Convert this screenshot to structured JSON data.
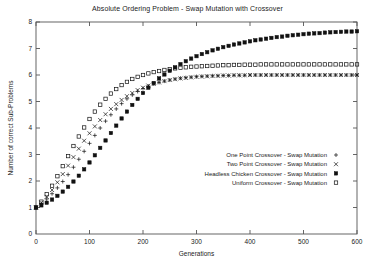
{
  "chart_data": {
    "type": "scatter",
    "title": "Absolute Ordering Problem - Swap Mutation with Crossover",
    "xlabel": "Generations",
    "ylabel": "Number of correct Sub-Problems",
    "xlim": [
      0,
      600
    ],
    "ylim": [
      0,
      8
    ],
    "xticks": [
      0,
      100,
      200,
      300,
      400,
      500,
      600
    ],
    "yticks": [
      1,
      2,
      3,
      4,
      5,
      6,
      7,
      8
    ],
    "grid": false,
    "legend_position": "center-right",
    "series": [
      {
        "name": "One Point Crossover - Swap Mutation",
        "marker": "+",
        "x": [
          0,
          10,
          20,
          30,
          40,
          50,
          60,
          70,
          80,
          90,
          100,
          110,
          120,
          130,
          140,
          150,
          160,
          170,
          180,
          190,
          200,
          210,
          220,
          230,
          240,
          250,
          260,
          270,
          280,
          290,
          300,
          310,
          320,
          330,
          340,
          350,
          360,
          370,
          380,
          390,
          400,
          410,
          420,
          430,
          440,
          450,
          460,
          470,
          480,
          490,
          500,
          510,
          520,
          530,
          540,
          550,
          560,
          570,
          580,
          590,
          600
        ],
        "y": [
          1.0,
          1.15,
          1.32,
          1.52,
          1.74,
          1.98,
          2.24,
          2.52,
          2.82,
          3.12,
          3.42,
          3.72,
          4.0,
          4.26,
          4.5,
          4.72,
          4.92,
          5.1,
          5.25,
          5.38,
          5.49,
          5.58,
          5.66,
          5.72,
          5.77,
          5.81,
          5.85,
          5.88,
          5.9,
          5.92,
          5.94,
          5.95,
          5.96,
          5.97,
          5.97,
          5.98,
          5.98,
          5.99,
          5.99,
          5.99,
          6.0,
          6.0,
          6.0,
          6.0,
          6.0,
          6.0,
          6.0,
          6.0,
          6.0,
          6.0,
          6.0,
          6.0,
          6.0,
          6.0,
          6.0,
          6.0,
          6.0,
          6.0,
          6.0,
          6.0,
          6.0
        ]
      },
      {
        "name": "Two Point Crossover - Swap Mutation",
        "marker": "x",
        "x": [
          0,
          10,
          20,
          30,
          40,
          50,
          60,
          70,
          80,
          90,
          100,
          110,
          120,
          130,
          140,
          150,
          160,
          170,
          180,
          190,
          200,
          210,
          220,
          230,
          240,
          250,
          260,
          270,
          280,
          290,
          300,
          310,
          320,
          330,
          340,
          350,
          360,
          370,
          380,
          390,
          400,
          410,
          420,
          430,
          440,
          450,
          460,
          470,
          480,
          490,
          500,
          510,
          520,
          530,
          540,
          550,
          560,
          570,
          580,
          590,
          600
        ],
        "y": [
          1.0,
          1.18,
          1.4,
          1.66,
          1.95,
          2.26,
          2.58,
          2.9,
          3.22,
          3.52,
          3.8,
          4.06,
          4.3,
          4.52,
          4.72,
          4.9,
          5.06,
          5.2,
          5.32,
          5.43,
          5.52,
          5.6,
          5.66,
          5.72,
          5.77,
          5.81,
          5.84,
          5.87,
          5.89,
          5.91,
          5.93,
          5.94,
          5.95,
          5.96,
          5.97,
          5.98,
          5.98,
          5.99,
          5.99,
          5.99,
          6.0,
          6.0,
          6.0,
          6.0,
          6.0,
          6.0,
          6.0,
          6.0,
          6.0,
          6.0,
          6.0,
          6.0,
          6.0,
          6.0,
          6.0,
          6.0,
          6.0,
          6.0,
          6.0,
          6.0,
          6.0
        ]
      },
      {
        "name": "Headless Chicken Crossover - Swap Mutation",
        "marker": "filled-square",
        "x": [
          0,
          10,
          20,
          30,
          40,
          50,
          60,
          70,
          80,
          90,
          100,
          110,
          120,
          130,
          140,
          150,
          160,
          170,
          180,
          190,
          200,
          210,
          220,
          230,
          240,
          250,
          260,
          270,
          280,
          290,
          300,
          310,
          320,
          330,
          340,
          350,
          360,
          370,
          380,
          390,
          400,
          410,
          420,
          430,
          440,
          450,
          460,
          470,
          480,
          490,
          500,
          510,
          520,
          530,
          540,
          550,
          560,
          570,
          580,
          590,
          600
        ],
        "y": [
          1.0,
          1.08,
          1.18,
          1.3,
          1.44,
          1.6,
          1.78,
          1.98,
          2.2,
          2.44,
          2.7,
          2.97,
          3.25,
          3.53,
          3.81,
          4.09,
          4.36,
          4.62,
          4.87,
          5.1,
          5.32,
          5.52,
          5.7,
          5.87,
          6.02,
          6.16,
          6.29,
          6.41,
          6.52,
          6.62,
          6.71,
          6.79,
          6.86,
          6.93,
          6.99,
          7.05,
          7.1,
          7.15,
          7.19,
          7.23,
          7.27,
          7.31,
          7.34,
          7.37,
          7.4,
          7.43,
          7.45,
          7.48,
          7.5,
          7.52,
          7.54,
          7.56,
          7.57,
          7.58,
          7.6,
          7.61,
          7.62,
          7.63,
          7.64,
          7.64,
          7.65
        ]
      },
      {
        "name": "Uniform Crossover - Swap Mutation",
        "marker": "square",
        "x": [
          0,
          10,
          20,
          30,
          40,
          50,
          60,
          70,
          80,
          90,
          100,
          110,
          120,
          130,
          140,
          150,
          160,
          170,
          180,
          190,
          200,
          210,
          220,
          230,
          240,
          250,
          260,
          270,
          280,
          290,
          300,
          310,
          320,
          330,
          340,
          350,
          360,
          370,
          380,
          390,
          400,
          410,
          420,
          430,
          440,
          450,
          460,
          470,
          480,
          490,
          500,
          510,
          520,
          530,
          540,
          550,
          560,
          570,
          580,
          590,
          600
        ],
        "y": [
          1.0,
          1.22,
          1.5,
          1.82,
          2.18,
          2.56,
          2.94,
          3.32,
          3.68,
          4.02,
          4.34,
          4.62,
          4.88,
          5.1,
          5.3,
          5.47,
          5.62,
          5.74,
          5.85,
          5.93,
          6.0,
          6.06,
          6.11,
          6.15,
          6.19,
          6.22,
          6.25,
          6.27,
          6.29,
          6.31,
          6.32,
          6.33,
          6.34,
          6.35,
          6.36,
          6.37,
          6.37,
          6.38,
          6.38,
          6.39,
          6.39,
          6.39,
          6.4,
          6.4,
          6.4,
          6.4,
          6.4,
          6.4,
          6.4,
          6.4,
          6.4,
          6.4,
          6.4,
          6.4,
          6.4,
          6.4,
          6.4,
          6.4,
          6.4,
          6.4,
          6.4
        ]
      }
    ]
  },
  "colors": {
    "axis": "#555555",
    "marker": "#111111",
    "text": "#222222",
    "background": "#ffffff"
  }
}
